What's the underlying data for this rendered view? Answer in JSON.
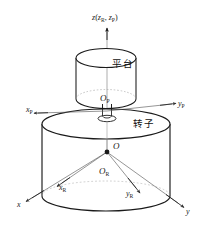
{
  "figure": {
    "background_color": "#ffffff",
    "line_color": "#1a1a1a",
    "thin_line_color": "#555555"
  },
  "bodies": [
    {
      "id": "platform",
      "name": "platform-cylinder",
      "label": "平台",
      "label_meaning": "platform",
      "origin_label": "O",
      "origin_subscript": "P"
    },
    {
      "id": "rotor",
      "name": "rotor-cylinder",
      "label": "转子",
      "label_meaning": "rotor",
      "origin_label": "O",
      "origin_subscript": "R"
    }
  ],
  "origin": {
    "label": "O",
    "name": "global-origin"
  },
  "axes": {
    "vertical": {
      "name": "z-axis",
      "main": "z",
      "paren_open": "(",
      "rotor": "z",
      "rotor_sub": "R",
      "comma": ", ",
      "platform": "z",
      "platform_sub": "P",
      "paren_close": ")"
    },
    "global": [
      {
        "name": "x-axis",
        "symbol": "x",
        "subscript": ""
      },
      {
        "name": "y-axis",
        "symbol": "y",
        "subscript": ""
      }
    ],
    "rotor": [
      {
        "name": "xr-axis",
        "symbol": "x",
        "subscript": "R"
      },
      {
        "name": "yr-axis",
        "symbol": "y",
        "subscript": "R"
      }
    ],
    "platform": [
      {
        "name": "xp-axis",
        "symbol": "x",
        "subscript": "P"
      },
      {
        "name": "yp-axis",
        "symbol": "y",
        "subscript": "P"
      }
    ]
  },
  "origins": {
    "platform": {
      "symbol": "O",
      "subscript": "P"
    },
    "rotor": {
      "symbol": "O",
      "subscript": "R"
    },
    "global": {
      "symbol": "O",
      "subscript": ""
    }
  }
}
